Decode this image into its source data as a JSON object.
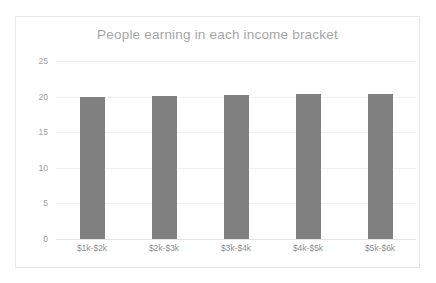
{
  "chart_data": {
    "type": "bar",
    "title": "People earning in each income bracket",
    "xlabel": "",
    "ylabel": "",
    "categories": [
      "$1k-$2k",
      "$2k-$3k",
      "$3k-$4k",
      "$4k-$5k",
      "$5k-$6k"
    ],
    "values": [
      20.0,
      20.1,
      20.2,
      20.3,
      20.4
    ],
    "ylim": [
      0,
      25
    ],
    "yticks": [
      0,
      5,
      10,
      15,
      20,
      25
    ],
    "ytick_labels": [
      "0",
      "5",
      "10",
      "15",
      "20",
      "25"
    ],
    "grid": true,
    "legend": false,
    "series": [
      {
        "name": "People",
        "values": [
          20.0,
          20.1,
          20.2,
          20.3,
          20.4
        ],
        "color": "#808080"
      }
    ],
    "colors": {
      "bar": "#808080",
      "gridline": "#f0f0f0",
      "title_text": "#a6a6a6",
      "tick_text": "#9e9e9e",
      "plot_background": "#ffffff",
      "border": "#e8e8e8"
    }
  }
}
